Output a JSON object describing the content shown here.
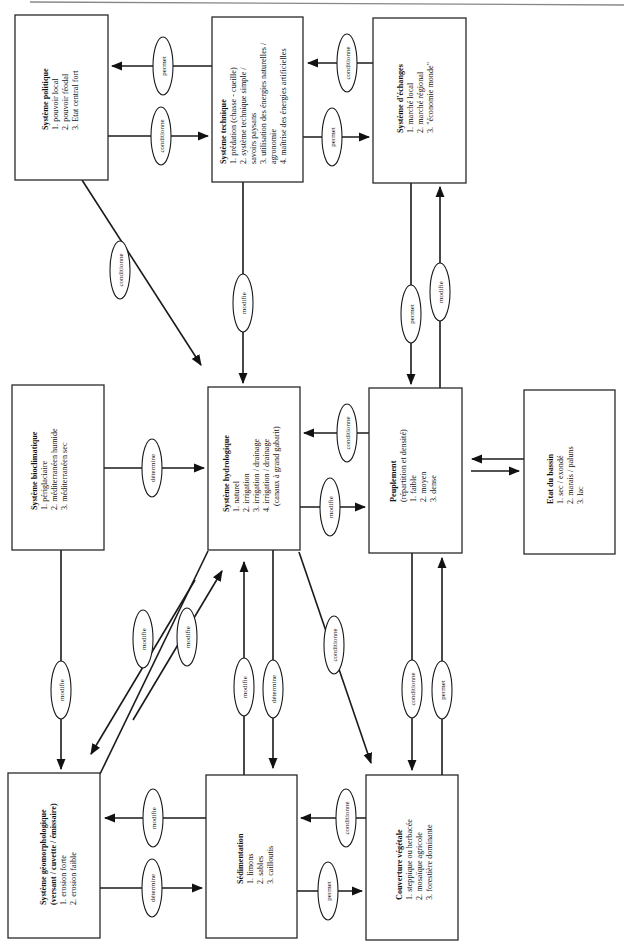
{
  "diagram": {
    "orientation": "rotated 90° counter-clockwise",
    "boxes": {
      "politique": {
        "title": "Système politique",
        "items": [
          "1. pouvoir local",
          "2. pouvoir féodal",
          "3. Etat central fort"
        ]
      },
      "technique": {
        "title": "Système technique",
        "items": [
          "1. prédation (chasse - cueille)",
          "2. système technique simple /",
          "savoirs paysans",
          "3. utilisation des énergies naturelles /",
          "agronomie",
          "4. maîtrise des énergies artificielles"
        ]
      },
      "echanges": {
        "title": "Système d'échanges",
        "items": [
          "1. marché local",
          "2. marché régional",
          "3. \"économie monde\""
        ]
      },
      "bioclimatique": {
        "title": "Système bioclimatique",
        "items": [
          "1. périglaciaire",
          "2. méditerranéen humide",
          "3. méditerranéen sec"
        ]
      },
      "hydrologique": {
        "title": "Système hydrologique",
        "items": [
          "1. naturel",
          "2. irrigation",
          "3. irrigation / drainage",
          "4. irrigation / drainage",
          "(canaux à grand gabarit)"
        ]
      },
      "peuplement": {
        "title": "Peuplement",
        "items": [
          "(répartition et densité)",
          "1. faible",
          "2. moyen",
          "3. dense"
        ]
      },
      "bassin": {
        "title": "Etat du bassin",
        "items": [
          "1. sec / exondé",
          "2. marais / paluns",
          "3. lac"
        ]
      },
      "geomorphologique": {
        "title": "Système géomorphologique",
        "items": [
          "(versant / cuvette / émissaire)",
          "1. erosion forte",
          "2. erosion faible"
        ]
      },
      "sedimentation": {
        "title": "Sédimentation",
        "items": [
          "1. limons",
          "2. sables",
          "3. cailloutis"
        ]
      },
      "vegetale": {
        "title": "Couverture végétale",
        "items": [
          "1. steppique ou herbacée",
          "2. mosaïque agricole",
          "3. forestière dominante"
        ]
      }
    },
    "relations": {
      "technique_to_politique": "permet",
      "politique_to_technique": "conditionne",
      "echanges_to_technique": "conditionne",
      "technique_to_echanges": "permet",
      "politique_to_hydrologique": "conditionne",
      "technique_to_hydrologique": "modifie",
      "echanges_to_peuplement": "permet",
      "peuplement_to_echanges": "modifie",
      "bioclimatique_to_hydrologique": "détermine",
      "peuplement_to_hydrologique": "conditionne",
      "hydrologique_to_peuplement": "modifie",
      "bioclimatique_to_geomorphologique": "modifie",
      "hydrologique_to_geomorphologique": "modifie",
      "geomorphologique_to_hydrologique": "modifie",
      "sedimentation_to_hydrologique": "modifie",
      "hydrologique_to_sedimentation": "détermine",
      "hydrologique_to_vegetale": "conditionne",
      "peuplement_to_vegetale": "conditionne",
      "vegetale_to_peuplement": "permet",
      "sedimentation_to_geomorphologique": "modifie",
      "geomorphologique_to_sedimentation": "détermine",
      "vegetale_to_sedimentation": "conditionne",
      "sedimentation_to_vegetale": "permet"
    }
  }
}
